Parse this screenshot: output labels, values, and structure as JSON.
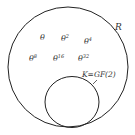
{
  "diagram": {
    "outer_set": {
      "label": "R",
      "stroke": "#222222"
    },
    "inner_set": {
      "label": "K=GF(2)",
      "stroke": "#222222"
    },
    "elements": [
      {
        "base": "θ",
        "exp": ""
      },
      {
        "base": "θ",
        "exp": "2"
      },
      {
        "base": "θ",
        "exp": "4"
      },
      {
        "base": "θ",
        "exp": "8"
      },
      {
        "base": "θ",
        "exp": "16"
      },
      {
        "base": "θ",
        "exp": "32"
      }
    ]
  }
}
